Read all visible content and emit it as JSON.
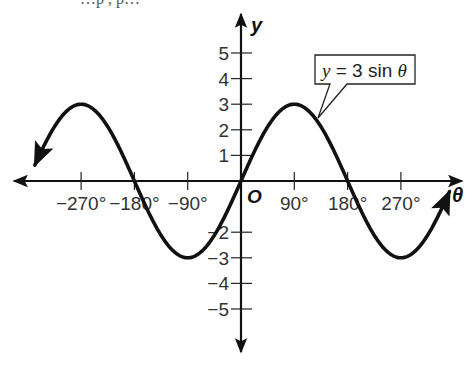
{
  "chart_data": {
    "type": "line",
    "title": "",
    "function": "y = 3 sin θ",
    "xlabel": "θ",
    "ylabel": "y",
    "origin_label": "O",
    "xlim": [
      -360,
      370
    ],
    "ylim": [
      -6,
      6.5
    ],
    "x_ticks": [
      -270,
      -180,
      -90,
      90,
      180,
      270
    ],
    "x_tick_labels": [
      "−270°",
      "−180°",
      "−90°",
      "90°",
      "180°",
      "270°"
    ],
    "y_ticks": [
      5,
      4,
      3,
      2,
      1,
      -2,
      -3,
      -4,
      -5
    ],
    "y_tick_labels": [
      "5",
      "4",
      "3",
      "2",
      "1",
      "−2",
      "−3",
      "−4",
      "−5"
    ],
    "grid": false,
    "series": [
      {
        "name": "y = 3 sin θ",
        "x": [
          -340,
          -315,
          -270,
          -225,
          -180,
          -135,
          -90,
          -45,
          0,
          45,
          90,
          135,
          180,
          225,
          270,
          315,
          350
        ],
        "values": [
          1.03,
          2.12,
          3,
          2.12,
          0,
          -2.12,
          -3,
          -2.12,
          0,
          2.12,
          3,
          2.12,
          0,
          -2.12,
          -3,
          -2.12,
          -0.52
        ],
        "amplitude": 3,
        "period_degrees": 360,
        "arrows_both_ends": true
      }
    ],
    "annotations": [
      {
        "text": "y = 3 sin θ",
        "type": "callout",
        "points_to": [
          135,
          2.12
        ]
      }
    ]
  },
  "labels": {
    "y_axis": "y",
    "x_axis": "θ",
    "origin": "O",
    "callout_prefix": "y",
    "callout_mid": " = 3 sin ",
    "callout_suffix": "θ",
    "top_fragment": "…p          , p…"
  },
  "colors": {
    "curve": "#111111",
    "axis": "#111111",
    "text": "#333333",
    "background": "#ffffff"
  }
}
